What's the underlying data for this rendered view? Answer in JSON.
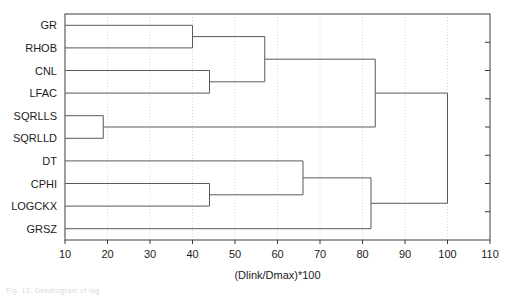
{
  "figure": {
    "caption_clipped": "Fig. 12. Dendrogram of log",
    "plot_bg": "#ffffff",
    "line_color": "#5a5a5a",
    "axis_color": "#3c3c3c",
    "grid_color": "#d9d9d9"
  },
  "chart_data": {
    "type": "dendrogram",
    "title": "",
    "xlabel": "(Dlink/Dmax)*100",
    "ylabel": "",
    "xlim": [
      10,
      110
    ],
    "xticks": [
      10,
      20,
      30,
      40,
      50,
      60,
      70,
      80,
      90,
      100,
      110
    ],
    "xticklabels": [
      "10",
      "20",
      "30",
      "40",
      "50",
      "60",
      "70",
      "80",
      "90",
      "100",
      "110"
    ],
    "grid": true,
    "grid_axis": "x",
    "legend": "none",
    "leaves": [
      "GR",
      "RHOB",
      "CNL",
      "LFAC",
      "SQRLLS",
      "SQRLLD",
      "DT",
      "CPHI",
      "LOGCKX",
      "GRSZ"
    ],
    "leaf_order_top_to_bottom": [
      "GR",
      "RHOB",
      "CNL",
      "LFAC",
      "SQRLLS",
      "SQRLLD",
      "DT",
      "CPHI",
      "LOGCKX",
      "GRSZ"
    ],
    "merges": [
      {
        "id": "m1",
        "members": [
          "SQRLLS",
          "SQRLLD"
        ],
        "distance": 19
      },
      {
        "id": "m2",
        "members": [
          "GR",
          "RHOB"
        ],
        "distance": 40
      },
      {
        "id": "m3",
        "members": [
          "CNL",
          "LFAC"
        ],
        "distance": 44
      },
      {
        "id": "m4",
        "members": [
          "CPHI",
          "LOGCKX"
        ],
        "distance": 44
      },
      {
        "id": "m5",
        "members": [
          "m2",
          "m3"
        ],
        "distance": 57
      },
      {
        "id": "m6",
        "members": [
          "m4",
          "DT"
        ],
        "distance": 66
      },
      {
        "id": "m7",
        "members": [
          "m6",
          "GRSZ"
        ],
        "distance": 82
      },
      {
        "id": "m8",
        "members": [
          "m5",
          "m1"
        ],
        "distance": 83
      },
      {
        "id": "m9",
        "members": [
          "m8",
          "m7"
        ],
        "distance": 100
      }
    ]
  }
}
